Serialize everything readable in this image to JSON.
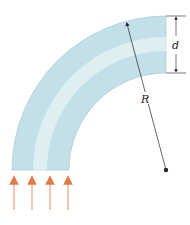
{
  "diagram": {
    "labels": {
      "diameter": "d",
      "radius": "R"
    },
    "colors": {
      "pipe": "#bcdde6",
      "pipe_highlight": "#e8f4f7",
      "pipe_edge": "#8fb9c6",
      "arrow": "#e07a4a",
      "line": "#222222"
    }
  }
}
